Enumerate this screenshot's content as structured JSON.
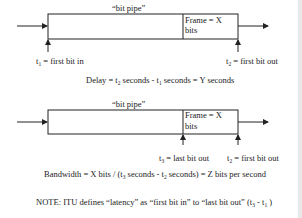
{
  "diagram1": {
    "pipe_label": "“bit pipe”",
    "frame_label_line1": "Frame = X",
    "frame_label_line2": "bits",
    "t1_label": "t",
    "t1_sub": "1",
    "t1_text": " = first bit in",
    "t2_label": "t",
    "t2_sub": "2",
    "t2_text": " = first bit out",
    "formula_a": "Delay = t",
    "formula_sub2": "2",
    "formula_b": " seconds - t",
    "formula_sub1": "1",
    "formula_c": " seconds = Y seconds"
  },
  "diagram2": {
    "pipe_label": "“bit pipe”",
    "frame_label_line1": "Frame = X",
    "frame_label_line2": "bits",
    "t3_label": "t",
    "t3_sub": "3",
    "t3_text": " = last bit out",
    "t2_label": "t",
    "t2_sub": "2",
    "t2_text": " = first bit out",
    "formula_a": "Bandwidth = X bits / (t",
    "formula_sub3": "3",
    "formula_b": " seconds - t",
    "formula_sub2": "2",
    "formula_c": " seconds) = Z bits per second"
  },
  "note": {
    "text_a": "NOTE: ITU defines “latency” as “first bit in” to “last bit out” (t",
    "sub3": "3",
    "text_b": " - t",
    "sub1": "1",
    "text_c": " )"
  }
}
